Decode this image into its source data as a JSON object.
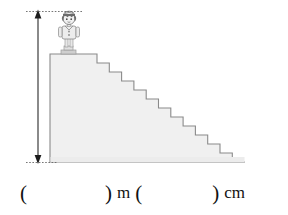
{
  "page": {
    "width": 288,
    "height": 215,
    "background_color": "#ffffff"
  },
  "colors": {
    "stair_fill": "#f0f0f0",
    "stair_stroke": "#8a8a8a",
    "dimension_line": "#222222",
    "guide_line": "#555555",
    "text": "#111111",
    "figure_dark": "#6b6b6b",
    "figure_light": "#d9d9d9",
    "watermark": "#f2f2f2"
  },
  "diagram": {
    "name": "staircase-with-child-figure",
    "dimension_arrow": {
      "name": "height-dimension-arrow",
      "orientation": "vertical",
      "double_headed": true,
      "x": 38,
      "y_top": 11,
      "y_bottom": 162,
      "pixel_length": 151
    },
    "guide_top": {
      "y": 11,
      "x_start": 26,
      "x_end": 82,
      "style": "dotted"
    },
    "guide_bottom": {
      "y": 162,
      "x_start": 26,
      "x_end": 56,
      "style": "dotted"
    },
    "staircase": {
      "name": "staircase-shape",
      "top_left_x": 50,
      "top_y": 54,
      "baseline_y": 162,
      "right_x": 245,
      "platform_end_x": 97,
      "step_count": 12,
      "step_width": 12.3,
      "step_height": 9,
      "fill": "#f0f0f0",
      "stroke": "#8a8a8a"
    },
    "child": {
      "name": "child-figure",
      "standing_on": "top-platform",
      "x": 58,
      "y": 10,
      "width": 22,
      "height": 44,
      "description": "small cartoon child standing on the top step"
    },
    "watermark_text": ""
  },
  "answer": {
    "open_paren_1": "(",
    "blank_1_value": "",
    "close_paren_1": ")",
    "unit_1": "m",
    "open_paren_2": "(",
    "blank_2_value": "",
    "close_paren_2": ")",
    "unit_2": "cm"
  }
}
